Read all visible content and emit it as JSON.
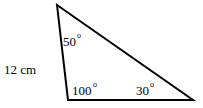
{
  "triangle": {
    "side_label": "12 cm",
    "angles": {
      "top": {
        "value": "50",
        "unit": "o"
      },
      "bottom_left": {
        "value": "100",
        "unit": "o"
      },
      "bottom_right": {
        "value": "30",
        "unit": "o"
      }
    },
    "stroke_color": "#000000"
  }
}
